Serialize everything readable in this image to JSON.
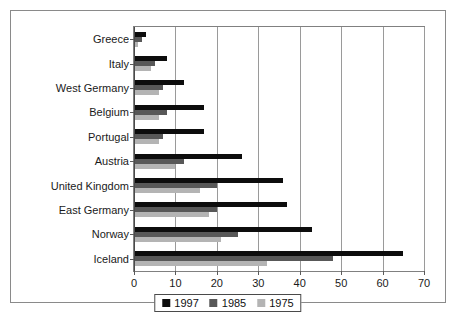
{
  "chart_data": {
    "type": "bar",
    "orientation": "horizontal",
    "title": "",
    "subtitle": "",
    "xlabel": "",
    "ylabel": "",
    "xlim": [
      0,
      70
    ],
    "ylim": null,
    "grid": true,
    "grid_axis": "x",
    "legend_position": "bottom-center",
    "xticks": [
      0,
      10,
      20,
      30,
      40,
      50,
      60,
      70
    ],
    "xtick_labels": [
      "0",
      "10",
      "20",
      "30",
      "40",
      "50",
      "60",
      "70"
    ],
    "categories": [
      "Greece",
      "Italy",
      "West Germany",
      "Belgium",
      "Portugal",
      "Austria",
      "United Kingdom",
      "East Germany",
      "Norway",
      "Iceland"
    ],
    "series": [
      {
        "name": "1997",
        "color": "#0d0d0d",
        "values": [
          3,
          8,
          12,
          17,
          17,
          26,
          36,
          37,
          43,
          65
        ]
      },
      {
        "name": "1985",
        "color": "#585858",
        "values": [
          2,
          5,
          7,
          8,
          7,
          12,
          20,
          20,
          25,
          48
        ]
      },
      {
        "name": "1975",
        "color": "#b4b4b4",
        "values": [
          1,
          4,
          6,
          6,
          6,
          10,
          16,
          18,
          21,
          32
        ]
      }
    ]
  },
  "legend": {
    "entries": [
      {
        "label": "1997",
        "color": "#0d0d0d"
      },
      {
        "label": "1985",
        "color": "#585858"
      },
      {
        "label": "1975",
        "color": "#b4b4b4"
      }
    ]
  }
}
